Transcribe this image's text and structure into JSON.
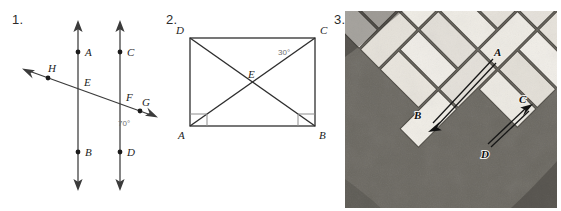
{
  "worksheet": {
    "background_color": "#ffffff",
    "figures": [
      {
        "number": "1.",
        "kind": "two-parallel-lines-with-transversal",
        "points": [
          {
            "label": "A",
            "x": 78,
            "y": 52,
            "label_dx": 7,
            "label_dy": 4
          },
          {
            "label": "B",
            "x": 78,
            "y": 152,
            "label_dx": 7,
            "label_dy": 4
          },
          {
            "label": "C",
            "x": 120,
            "y": 52,
            "label_dx": 7,
            "label_dy": 4
          },
          {
            "label": "D",
            "x": 120,
            "y": 152,
            "label_dx": 7,
            "label_dy": 4
          },
          {
            "label": "E",
            "x": 78,
            "y": 89,
            "label_dx": 6,
            "label_dy": -3
          },
          {
            "label": "F",
            "x": 120,
            "y": 104,
            "label_dx": 6,
            "label_dy": -3
          },
          {
            "label": "G",
            "x": 140,
            "y": 111,
            "label_dx": 4,
            "label_dy": 10
          },
          {
            "label": "H",
            "x": 48,
            "y": 78,
            "label_dx": 3,
            "label_dy": -5
          }
        ],
        "angle_marks": [
          {
            "value": "70°",
            "x": 121,
            "y": 122
          }
        ],
        "line_color": "#3b3b3b"
      },
      {
        "number": "2.",
        "kind": "rectangle-with-diagonals",
        "vertices": [
          {
            "label": "D",
            "x": 30,
            "y": 38,
            "label_dx": -14,
            "label_dy": -5
          },
          {
            "label": "C",
            "x": 155,
            "y": 38,
            "label_dx": 6,
            "label_dy": -5
          },
          {
            "label": "B",
            "x": 155,
            "y": 126,
            "label_dx": 5,
            "label_dy": 13
          },
          {
            "label": "A",
            "x": 30,
            "y": 126,
            "label_dx": -12,
            "label_dy": 13
          }
        ],
        "intersection": {
          "label": "E",
          "x": 92,
          "y": 82,
          "label_dx": -2,
          "label_dy": -5
        },
        "angle_marks": [
          {
            "value": "30°",
            "x": 122,
            "y": 52
          }
        ],
        "right_angle_marks": [
          "A",
          "B"
        ],
        "line_color": "#2e2e2e"
      },
      {
        "number": "3.",
        "kind": "herringbone-brick-photograph",
        "caption": "",
        "arrows": [
          {
            "from": "A",
            "to": "B",
            "from_x": 148,
            "to_x": 83,
            "from_y": 48,
            "to_y": 117
          },
          {
            "from": "C",
            "to": "D",
            "from_x": 185,
            "to_x": 143,
            "from_y": 94,
            "to_y": 133
          }
        ],
        "labels": [
          {
            "label": "A",
            "x": 152,
            "y": 44
          },
          {
            "label": "B",
            "x": 72,
            "y": 106
          },
          {
            "label": "C",
            "x": 180,
            "y": 91
          },
          {
            "label": "D",
            "x": 139,
            "y": 143
          }
        ],
        "photo_tone": "#eceae5"
      }
    ]
  }
}
